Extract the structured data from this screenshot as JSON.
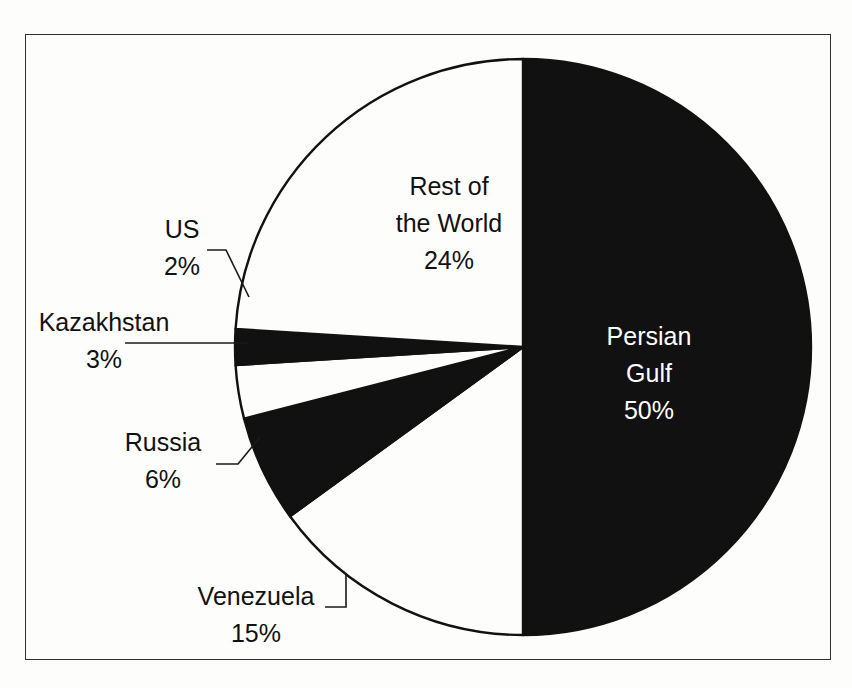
{
  "chart_data": {
    "type": "pie",
    "title": "",
    "subtitle": "",
    "xlabel": "",
    "ylabel": "",
    "legend_position": "none",
    "grid": false,
    "units": "percent",
    "total": 100,
    "start_angle_deg": 0,
    "direction": "clockwise",
    "categories": [
      "Persian Gulf",
      "Venezuela",
      "Russia",
      "Kazakhstan",
      "US",
      "Rest of the World"
    ],
    "values": [
      50,
      15,
      6,
      3,
      2,
      24
    ],
    "slices": [
      {
        "name": "Persian Gulf",
        "label": "Persian Gulf",
        "label_line1": "Persian",
        "label_line2": "Gulf",
        "value": 50,
        "value_label": "50%",
        "fill": "#111111",
        "stroke": "#111111",
        "text_color": "#ffffff",
        "label_placement": "inside",
        "has_leader": false
      },
      {
        "name": "Venezuela",
        "label": "Venezuela",
        "label_line1": "Venezuela",
        "label_line2": "",
        "value": 15,
        "value_label": "15%",
        "fill": "#fdfdfc",
        "stroke": "#111111",
        "text_color": "#111111",
        "label_placement": "outside",
        "has_leader": true
      },
      {
        "name": "Russia",
        "label": "Russia",
        "label_line1": "Russia",
        "label_line2": "",
        "value": 6,
        "value_label": "6%",
        "fill": "#111111",
        "stroke": "#111111",
        "text_color": "#111111",
        "label_placement": "outside",
        "has_leader": true
      },
      {
        "name": "Kazakhstan",
        "label": "Kazakhstan",
        "label_line1": "Kazakhstan",
        "label_line2": "",
        "value": 3,
        "value_label": "3%",
        "fill": "#fdfdfc",
        "stroke": "#111111",
        "text_color": "#111111",
        "label_placement": "outside",
        "has_leader": true
      },
      {
        "name": "US",
        "label": "US",
        "label_line1": "US",
        "label_line2": "",
        "value": 2,
        "value_label": "2%",
        "fill": "#111111",
        "stroke": "#111111",
        "text_color": "#111111",
        "label_placement": "outside",
        "has_leader": true
      },
      {
        "name": "Rest of the World",
        "label": "Rest of the World",
        "label_line1": "Rest of",
        "label_line2": "the World",
        "value": 24,
        "value_label": "24%",
        "fill": "#fdfdfc",
        "stroke": "#111111",
        "text_color": "#111111",
        "label_placement": "inside",
        "has_leader": false
      }
    ]
  },
  "labels": {
    "persian_gulf": {
      "line1": "Persian",
      "line2": "Gulf",
      "percent": "50%"
    },
    "rest_of_world": {
      "line1": "Rest of",
      "line2": "the World",
      "percent": "24%"
    },
    "us": {
      "name": "US",
      "percent": "2%"
    },
    "kazakhstan": {
      "name": "Kazakhstan",
      "percent": "3%"
    },
    "russia": {
      "name": "Russia",
      "percent": "6%"
    },
    "venezuela": {
      "name": "Venezuela",
      "percent": "15%"
    }
  },
  "colors": {
    "dark_slice": "#111111",
    "light_slice": "#fdfdfc",
    "outline": "#111111",
    "frame": "#2e2e33",
    "background": "#fdfdfc",
    "label_dark": "#111111",
    "label_light": "#ffffff"
  },
  "geometry": {
    "center_x": 523,
    "center_y": 347,
    "radius": 288
  }
}
